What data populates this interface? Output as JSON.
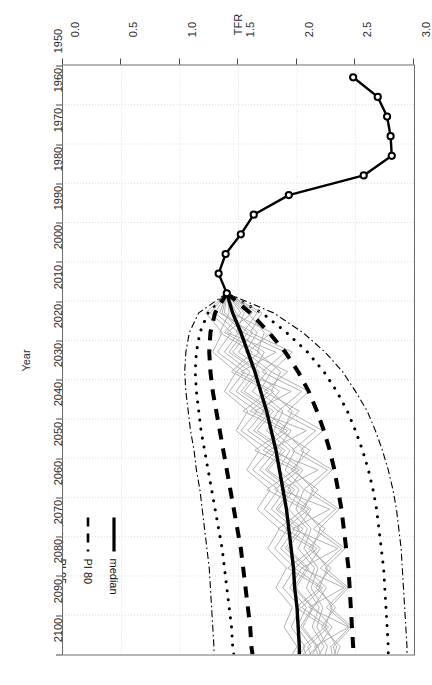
{
  "chart_data": {
    "type": "line",
    "title": "",
    "xlabel": "Year",
    "ylabel": "TFR",
    "xlim": [
      1950,
      2100
    ],
    "ylim": [
      0.0,
      3.0
    ],
    "grid": true,
    "legend_position": "bottom-right-inside",
    "x_ticks": [
      1950,
      1960,
      1970,
      1980,
      1990,
      2000,
      2010,
      2020,
      2030,
      2040,
      2050,
      2060,
      2070,
      2080,
      2090,
      2100
    ],
    "x_tick_labels": [
      "1950",
      "1960",
      "1970",
      "1980",
      "1990",
      "2000",
      "2010",
      "2020",
      "2030",
      "2040",
      "2050",
      "2060",
      "2070",
      "2080",
      "2090",
      "2100"
    ],
    "y_ticks": [
      0.0,
      0.5,
      1.0,
      1.5,
      2.0,
      2.5,
      3.0
    ],
    "y_tick_labels": [
      "0.0",
      "0.5",
      "1.0",
      "1.5",
      "2.0",
      "2.5",
      "3.0"
    ],
    "legend": [
      {
        "label": "median",
        "style": "solid",
        "width": 3.2,
        "color": "#000000"
      },
      {
        "label": "PI 80",
        "style": "dashed",
        "width": 2.6,
        "color": "#000000"
      },
      {
        "label": "PI 95",
        "style": "dotted",
        "width": 2.4,
        "color": "#000000"
      },
      {
        "label": "+/- 0.5 child",
        "style": "dashdot",
        "width": 1.1,
        "color": "#000000"
      },
      {
        "label": "observed TFR",
        "style": "solid-point",
        "width": 2.2,
        "color": "#000000"
      }
    ],
    "series": [
      {
        "name": "observed TFR",
        "style": "solid-open-circles",
        "x": [
          1953,
          1958,
          1963,
          1968,
          1973,
          1978,
          1983,
          1988,
          1993,
          1998,
          2003,
          2008
        ],
        "values": [
          2.48,
          2.69,
          2.77,
          2.8,
          2.81,
          2.57,
          1.93,
          1.63,
          1.52,
          1.39,
          1.33,
          1.4
        ]
      },
      {
        "name": "median",
        "style": "solid",
        "x": [
          2008,
          2013,
          2018,
          2023,
          2028,
          2033,
          2038,
          2043,
          2048,
          2053,
          2058,
          2063,
          2068,
          2073,
          2078,
          2083,
          2088,
          2093,
          2098,
          2100
        ],
        "values": [
          1.4,
          1.45,
          1.52,
          1.58,
          1.64,
          1.69,
          1.74,
          1.78,
          1.82,
          1.85,
          1.88,
          1.91,
          1.93,
          1.95,
          1.97,
          1.98,
          2.0,
          2.01,
          2.02,
          2.02
        ]
      },
      {
        "name": "PI 80 lower",
        "style": "dashed",
        "x": [
          2008,
          2013,
          2018,
          2023,
          2028,
          2033,
          2038,
          2043,
          2048,
          2053,
          2058,
          2063,
          2068,
          2073,
          2078,
          2083,
          2088,
          2093,
          2098,
          2100
        ],
        "values": [
          1.4,
          1.3,
          1.26,
          1.25,
          1.26,
          1.28,
          1.31,
          1.34,
          1.37,
          1.4,
          1.43,
          1.46,
          1.49,
          1.52,
          1.54,
          1.56,
          1.58,
          1.6,
          1.61,
          1.62
        ]
      },
      {
        "name": "PI 80 upper",
        "style": "dashed",
        "x": [
          2008,
          2013,
          2018,
          2023,
          2028,
          2033,
          2038,
          2043,
          2048,
          2053,
          2058,
          2063,
          2068,
          2073,
          2078,
          2083,
          2088,
          2093,
          2098,
          2100
        ],
        "values": [
          1.4,
          1.6,
          1.76,
          1.9,
          2.01,
          2.1,
          2.17,
          2.23,
          2.28,
          2.32,
          2.35,
          2.38,
          2.4,
          2.42,
          2.44,
          2.45,
          2.46,
          2.47,
          2.48,
          2.48
        ]
      },
      {
        "name": "PI 95 lower",
        "style": "dotted",
        "x": [
          2008,
          2013,
          2018,
          2023,
          2028,
          2033,
          2038,
          2043,
          2048,
          2053,
          2058,
          2063,
          2068,
          2073,
          2078,
          2083,
          2088,
          2093,
          2098,
          2100
        ],
        "values": [
          1.4,
          1.24,
          1.17,
          1.14,
          1.13,
          1.14,
          1.16,
          1.18,
          1.21,
          1.24,
          1.27,
          1.3,
          1.33,
          1.36,
          1.38,
          1.4,
          1.42,
          1.44,
          1.45,
          1.46
        ]
      },
      {
        "name": "PI 95 upper",
        "style": "dotted",
        "x": [
          2008,
          2013,
          2018,
          2023,
          2028,
          2033,
          2038,
          2043,
          2048,
          2053,
          2058,
          2063,
          2068,
          2073,
          2078,
          2083,
          2088,
          2093,
          2098,
          2100
        ],
        "values": [
          1.4,
          1.7,
          1.91,
          2.09,
          2.23,
          2.34,
          2.43,
          2.5,
          2.56,
          2.61,
          2.65,
          2.68,
          2.7,
          2.72,
          2.74,
          2.75,
          2.76,
          2.77,
          2.78,
          2.78
        ]
      },
      {
        "name": "+/- 0.5 child lower",
        "style": "dashdot",
        "x": [
          2008,
          2013,
          2018,
          2023,
          2028,
          2033,
          2038,
          2043,
          2048,
          2053,
          2058,
          2063,
          2068,
          2073,
          2078,
          2083,
          2088,
          2093,
          2098,
          2100
        ],
        "values": [
          1.4,
          1.16,
          1.08,
          1.05,
          1.04,
          1.05,
          1.07,
          1.09,
          1.12,
          1.14,
          1.17,
          1.19,
          1.21,
          1.23,
          1.25,
          1.26,
          1.27,
          1.28,
          1.29,
          1.29
        ]
      },
      {
        "name": "+/- 0.5 child upper",
        "style": "dashdot",
        "x": [
          2008,
          2013,
          2018,
          2023,
          2028,
          2033,
          2038,
          2043,
          2048,
          2053,
          2058,
          2063,
          2068,
          2073,
          2078,
          2083,
          2088,
          2093,
          2098,
          2100
        ],
        "values": [
          1.4,
          1.8,
          2.05,
          2.24,
          2.39,
          2.5,
          2.6,
          2.67,
          2.73,
          2.78,
          2.82,
          2.85,
          2.87,
          2.89,
          2.9,
          2.91,
          2.92,
          2.93,
          2.94,
          2.94
        ]
      }
    ],
    "trajectories": [
      {
        "name": "traj-1",
        "x": [
          2008,
          2013,
          2018,
          2023,
          2028,
          2033,
          2038,
          2043,
          2048,
          2053,
          2058,
          2063,
          2068,
          2073,
          2078,
          2083,
          2088,
          2093,
          2098,
          2100
        ],
        "values": [
          1.4,
          1.55,
          1.48,
          1.72,
          1.63,
          1.85,
          1.7,
          1.95,
          1.82,
          2.05,
          1.92,
          2.12,
          2.0,
          2.2,
          2.08,
          2.25,
          2.14,
          2.3,
          2.18,
          2.2
        ]
      },
      {
        "name": "traj-2",
        "x": [
          2008,
          2013,
          2018,
          2023,
          2028,
          2033,
          2038,
          2043,
          2048,
          2053,
          2058,
          2063,
          2068,
          2073,
          2078,
          2083,
          2088,
          2093,
          2098,
          2100
        ],
        "values": [
          1.4,
          1.38,
          1.58,
          1.45,
          1.68,
          1.55,
          1.8,
          1.66,
          1.9,
          1.75,
          1.98,
          1.84,
          2.05,
          1.92,
          2.1,
          1.99,
          2.14,
          2.05,
          2.18,
          2.1
        ]
      },
      {
        "name": "traj-3",
        "x": [
          2008,
          2013,
          2018,
          2023,
          2028,
          2033,
          2038,
          2043,
          2048,
          2053,
          2058,
          2063,
          2068,
          2073,
          2078,
          2083,
          2088,
          2093,
          2098,
          2100
        ],
        "values": [
          1.4,
          1.62,
          1.4,
          1.82,
          1.52,
          1.95,
          1.64,
          2.08,
          1.76,
          2.18,
          1.86,
          2.28,
          1.96,
          2.35,
          2.04,
          2.4,
          2.1,
          2.44,
          2.15,
          2.18
        ]
      },
      {
        "name": "traj-4",
        "x": [
          2008,
          2013,
          2018,
          2023,
          2028,
          2033,
          2038,
          2043,
          2048,
          2053,
          2058,
          2063,
          2068,
          2073,
          2078,
          2083,
          2088,
          2093,
          2098,
          2100
        ],
        "values": [
          1.4,
          1.3,
          1.5,
          1.38,
          1.6,
          1.48,
          1.72,
          1.58,
          1.82,
          1.68,
          1.9,
          1.78,
          1.98,
          1.86,
          2.04,
          1.94,
          2.08,
          2.0,
          2.12,
          2.05
        ]
      },
      {
        "name": "traj-5",
        "x": [
          2008,
          2013,
          2018,
          2023,
          2028,
          2033,
          2038,
          2043,
          2048,
          2053,
          2058,
          2063,
          2068,
          2073,
          2078,
          2083,
          2088,
          2093,
          2098,
          2100
        ],
        "values": [
          1.4,
          1.48,
          1.66,
          1.56,
          1.78,
          1.68,
          1.88,
          1.8,
          1.98,
          1.9,
          2.06,
          1.99,
          2.12,
          2.06,
          2.18,
          2.12,
          2.22,
          2.17,
          2.26,
          2.24
        ]
      },
      {
        "name": "traj-6",
        "x": [
          2008,
          2013,
          2018,
          2023,
          2028,
          2033,
          2038,
          2043,
          2048,
          2053,
          2058,
          2063,
          2068,
          2073,
          2078,
          2083,
          2088,
          2093,
          2098,
          2100
        ],
        "values": [
          1.4,
          1.42,
          1.34,
          1.62,
          1.44,
          1.76,
          1.54,
          1.88,
          1.64,
          1.98,
          1.74,
          2.06,
          1.84,
          2.14,
          1.92,
          2.2,
          1.99,
          2.24,
          2.05,
          2.08
        ]
      },
      {
        "name": "traj-7",
        "x": [
          2008,
          2013,
          2018,
          2023,
          2028,
          2033,
          2038,
          2043,
          2048,
          2053,
          2058,
          2063,
          2068,
          2073,
          2078,
          2083,
          2088,
          2093,
          2098,
          2100
        ],
        "values": [
          1.4,
          1.58,
          1.72,
          1.66,
          1.86,
          1.78,
          1.96,
          1.88,
          2.06,
          1.98,
          2.14,
          2.06,
          2.2,
          2.13,
          2.26,
          2.19,
          2.3,
          2.24,
          2.34,
          2.32
        ]
      },
      {
        "name": "traj-8",
        "x": [
          2008,
          2013,
          2018,
          2023,
          2028,
          2033,
          2038,
          2043,
          2048,
          2053,
          2058,
          2063,
          2068,
          2073,
          2078,
          2083,
          2088,
          2093,
          2098,
          2100
        ],
        "values": [
          1.4,
          1.26,
          1.44,
          1.32,
          1.55,
          1.42,
          1.66,
          1.52,
          1.76,
          1.62,
          1.84,
          1.72,
          1.92,
          1.81,
          1.98,
          1.88,
          2.03,
          1.95,
          2.07,
          2.02
        ]
      },
      {
        "name": "traj-9",
        "x": [
          2008,
          2013,
          2018,
          2023,
          2028,
          2033,
          2038,
          2043,
          2048,
          2053,
          2058,
          2063,
          2068,
          2073,
          2078,
          2083,
          2088,
          2093,
          2098,
          2100
        ],
        "values": [
          1.4,
          1.66,
          1.54,
          1.9,
          1.7,
          2.04,
          1.84,
          2.16,
          1.96,
          2.26,
          2.06,
          2.33,
          2.14,
          2.38,
          2.2,
          2.42,
          2.25,
          2.45,
          2.29,
          2.3
        ]
      },
      {
        "name": "traj-10",
        "x": [
          2008,
          2013,
          2018,
          2023,
          2028,
          2033,
          2038,
          2043,
          2048,
          2053,
          2058,
          2063,
          2068,
          2073,
          2078,
          2083,
          2088,
          2093,
          2098,
          2100
        ],
        "values": [
          1.4,
          1.34,
          1.62,
          1.5,
          1.74,
          1.62,
          1.84,
          1.74,
          1.94,
          1.84,
          2.02,
          1.93,
          2.09,
          2.01,
          2.15,
          2.08,
          2.19,
          2.13,
          2.23,
          2.19
        ]
      },
      {
        "name": "traj-11",
        "x": [
          2008,
          2013,
          2018,
          2023,
          2028,
          2033,
          2038,
          2043,
          2048,
          2053,
          2058,
          2063,
          2068,
          2073,
          2078,
          2083,
          2088,
          2093,
          2098,
          2100
        ],
        "values": [
          1.4,
          1.52,
          1.38,
          1.68,
          1.48,
          1.8,
          1.6,
          1.92,
          1.71,
          2.02,
          1.81,
          2.1,
          1.9,
          2.17,
          1.98,
          2.22,
          2.04,
          2.27,
          2.09,
          2.12
        ]
      },
      {
        "name": "traj-12",
        "x": [
          2008,
          2013,
          2018,
          2023,
          2028,
          2033,
          2038,
          2043,
          2048,
          2053,
          2058,
          2063,
          2068,
          2073,
          2078,
          2083,
          2088,
          2093,
          2098,
          2100
        ],
        "values": [
          1.4,
          1.44,
          1.78,
          1.58,
          1.92,
          1.72,
          2.02,
          1.85,
          2.11,
          1.95,
          2.18,
          2.03,
          2.24,
          2.1,
          2.29,
          2.16,
          2.33,
          2.21,
          2.37,
          2.34
        ]
      },
      {
        "name": "traj-13",
        "x": [
          2008,
          2013,
          2018,
          2023,
          2028,
          2033,
          2038,
          2043,
          2048,
          2053,
          2058,
          2063,
          2068,
          2073,
          2078,
          2083,
          2088,
          2093,
          2098,
          2100
        ],
        "values": [
          1.4,
          1.22,
          1.36,
          1.28,
          1.48,
          1.38,
          1.58,
          1.48,
          1.68,
          1.57,
          1.77,
          1.66,
          1.85,
          1.75,
          1.91,
          1.82,
          1.96,
          1.89,
          2.0,
          1.96
        ]
      },
      {
        "name": "traj-14",
        "x": [
          2008,
          2013,
          2018,
          2023,
          2028,
          2033,
          2038,
          2043,
          2048,
          2053,
          2058,
          2063,
          2068,
          2073,
          2078,
          2083,
          2088,
          2093,
          2098,
          2100
        ],
        "values": [
          1.4,
          1.7,
          1.6,
          1.96,
          1.78,
          2.1,
          1.92,
          2.22,
          2.03,
          2.3,
          2.12,
          2.36,
          2.19,
          2.41,
          2.24,
          2.44,
          2.28,
          2.47,
          2.31,
          2.33
        ]
      },
      {
        "name": "traj-15",
        "x": [
          2008,
          2013,
          2018,
          2023,
          2028,
          2033,
          2038,
          2043,
          2048,
          2053,
          2058,
          2063,
          2068,
          2073,
          2078,
          2083,
          2088,
          2093,
          2098,
          2100
        ],
        "values": [
          1.4,
          1.36,
          1.54,
          1.42,
          1.66,
          1.52,
          1.77,
          1.63,
          1.87,
          1.73,
          1.95,
          1.82,
          2.02,
          1.9,
          2.08,
          1.97,
          2.13,
          2.03,
          2.17,
          2.13
        ]
      }
    ]
  }
}
